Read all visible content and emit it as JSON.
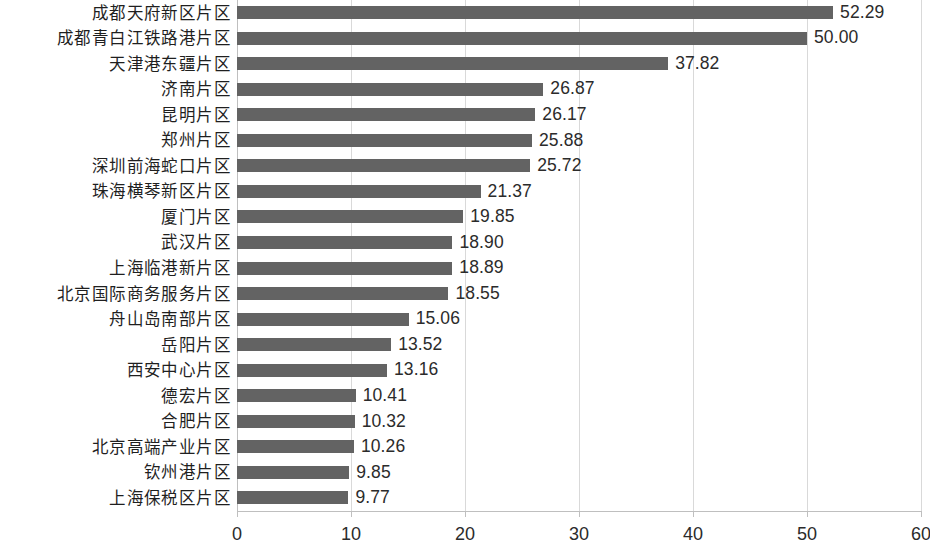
{
  "chart_data": {
    "type": "bar",
    "orientation": "horizontal",
    "title": "",
    "subtitle": "",
    "xlabel": "",
    "ylabel": "",
    "xlim": [
      0,
      60
    ],
    "ylim": null,
    "grid": "vertical",
    "legend": null,
    "bar_color": "#636363",
    "gridline_color": "#d9d9d9",
    "axis_color": "#bfbfbf",
    "background_color": "#ffffff",
    "xticks": [
      0,
      10,
      20,
      30,
      40,
      50,
      60
    ],
    "xtick_labels": [
      "0",
      "10",
      "20",
      "30",
      "40",
      "50",
      "60"
    ],
    "value_label_format": "0.00",
    "categories": [
      "成都天府新区片区",
      "成都青白江铁路港片区",
      "天津港东疆片区",
      "济南片区",
      "昆明片区",
      "郑州片区",
      "深圳前海蛇口片区",
      "珠海横琴新区片区",
      "厦门片区",
      "武汉片区",
      "上海临港新片区",
      "北京国际商务服务片区",
      "舟山岛南部片区",
      "岳阳片区",
      "西安中心片区",
      "德宏片区",
      "合肥片区",
      "北京高端产业片区",
      "钦州港片区",
      "上海保税区片区"
    ],
    "values": [
      52.29,
      50.0,
      37.82,
      26.87,
      26.17,
      25.88,
      25.72,
      21.37,
      19.85,
      18.9,
      18.89,
      18.55,
      15.06,
      13.52,
      13.16,
      10.41,
      10.32,
      10.26,
      9.85,
      9.77
    ],
    "value_labels": [
      "52.29",
      "50.00",
      "37.82",
      "26.87",
      "26.17",
      "25.88",
      "25.72",
      "21.37",
      "19.85",
      "18.90",
      "18.89",
      "18.55",
      "15.06",
      "13.52",
      "13.16",
      "10.41",
      "10.32",
      "10.26",
      "9.85",
      "9.77"
    ]
  }
}
